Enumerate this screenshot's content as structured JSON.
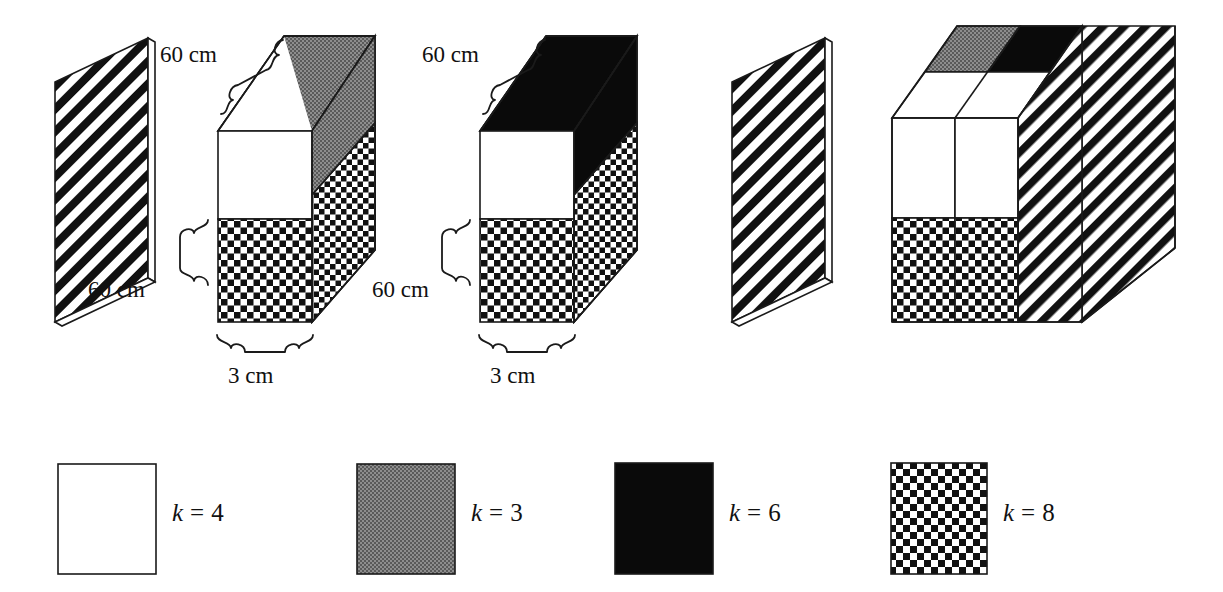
{
  "figure": {
    "background_color": "#ffffff",
    "line_color": "#1a1a1a"
  },
  "palette": {
    "white": "#ffffff",
    "gray": "#808080",
    "black": "#0a0a0a",
    "checker_dark": "#111111",
    "checker_light": "#ffffff",
    "stripe_dark": "#111111",
    "stripe_light": "#ffffff"
  },
  "dimension_labels": {
    "assembly1_top": "60 cm",
    "assembly1_left": "60 cm",
    "assembly1_bottom": "3 cm",
    "assembly2_top": "60 cm",
    "assembly2_left": "60 cm",
    "assembly2_bottom": "3 cm"
  },
  "assemblies": [
    {
      "name": "plate-left-striped",
      "kind": "plate",
      "fill": "diagonal-stripe",
      "k": 4
    },
    {
      "name": "box-gray-backing",
      "kind": "box",
      "front_top_fill": "white",
      "front_bottom_fill": "checker",
      "backing_fill": "gray",
      "side_fill": "checker",
      "labels": [
        "60 cm",
        "60 cm",
        "3 cm"
      ]
    },
    {
      "name": "box-black-backing",
      "kind": "box",
      "front_top_fill": "white",
      "front_bottom_fill": "checker",
      "backing_fill": "black",
      "side_fill": "checker",
      "labels": [
        "60 cm",
        "60 cm",
        "3 cm"
      ]
    },
    {
      "name": "plate-right-striped",
      "kind": "plate",
      "fill": "diagonal-stripe",
      "k": 4
    },
    {
      "name": "cube-combined",
      "kind": "cube",
      "top_left_fill": "gray",
      "top_right_fill": "black",
      "front_top_fill": "white",
      "front_bottom_fill": "checker",
      "right_side_fill": "diagonal-stripe"
    }
  ],
  "legend": {
    "items": [
      {
        "swatch": "white",
        "label": "k = 4",
        "k_symbol": "k",
        "equals": "=",
        "value": "4"
      },
      {
        "swatch": "gray",
        "label": "k = 3",
        "k_symbol": "k",
        "equals": "=",
        "value": "3"
      },
      {
        "swatch": "black",
        "label": "k = 6",
        "k_symbol": "k",
        "equals": "=",
        "value": "6"
      },
      {
        "swatch": "checker",
        "label": "k = 8",
        "k_symbol": "k",
        "equals": "=",
        "value": "8"
      }
    ]
  }
}
